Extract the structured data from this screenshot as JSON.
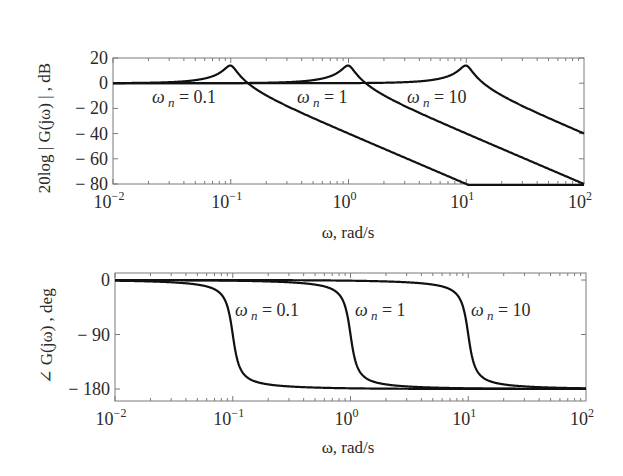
{
  "chart_data": [
    {
      "type": "line",
      "title": "",
      "xlabel": "ω,  rad/s",
      "ylabel": "20log | G(jω) | , dB",
      "xscale": "log",
      "xlim": [
        0.01,
        100
      ],
      "ylim": [
        -80,
        20
      ],
      "xticks": [
        0.01,
        0.1,
        1,
        10,
        100
      ],
      "xtick_labels": [
        {
          "base": "10",
          "exp": "−2"
        },
        {
          "base": "10",
          "exp": "−1"
        },
        {
          "base": "10",
          "exp": "0"
        },
        {
          "base": "10",
          "exp": "1"
        },
        {
          "base": "10",
          "exp": "2"
        }
      ],
      "yticks": [
        20,
        0,
        -20,
        -40,
        -60,
        -80
      ],
      "ytick_labels": [
        "20",
        "0",
        "− 20",
        "− 40",
        "− 60",
        "− 80"
      ],
      "grid": false,
      "legend": "none (inline annotations)",
      "model": {
        "form": "ωn² / (s² + 2ζωn s + ωn²)",
        "zeta": 0.1
      },
      "series": [
        {
          "name": "ωn = 0.1",
          "wn": 0.1,
          "x": [
            0.01,
            0.05,
            0.1,
            0.2,
            1,
            10
          ],
          "values": [
            0.0,
            2.4,
            14.0,
            -9.5,
            -40.0,
            -80.0
          ]
        },
        {
          "name": "ωn = 1",
          "wn": 1,
          "x": [
            0.01,
            0.5,
            1,
            2,
            10,
            100
          ],
          "values": [
            0.0,
            2.4,
            14.0,
            -9.5,
            -40.0,
            -80.0
          ]
        },
        {
          "name": "ωn = 10",
          "wn": 10,
          "x": [
            0.01,
            5,
            10,
            20,
            100
          ],
          "values": [
            0.0,
            2.4,
            14.0,
            -9.5,
            -40.0
          ]
        }
      ],
      "annotations": [
        {
          "text_var": "ω",
          "text_sub": "n",
          "text_rest": " = 0.1",
          "x_px": 152,
          "y_px": 103
        },
        {
          "text_var": "ω",
          "text_sub": "n",
          "text_rest": " = 1",
          "x_px": 297,
          "y_px": 103
        },
        {
          "text_var": "ω",
          "text_sub": "n",
          "text_rest": " = 10",
          "x_px": 407,
          "y_px": 103
        }
      ]
    },
    {
      "type": "line",
      "title": "",
      "xlabel": "ω,  rad/s",
      "ylabel": "∠ G(jω) , deg",
      "xscale": "log",
      "xlim": [
        0.01,
        100
      ],
      "ylim": [
        -195,
        12
      ],
      "xticks": [
        0.01,
        0.1,
        1,
        10,
        100
      ],
      "xtick_labels": [
        {
          "base": "10",
          "exp": "−2"
        },
        {
          "base": "10",
          "exp": "−1"
        },
        {
          "base": "10",
          "exp": "0"
        },
        {
          "base": "10",
          "exp": "1"
        },
        {
          "base": "10",
          "exp": "2"
        }
      ],
      "yticks": [
        0,
        -90,
        -180
      ],
      "ytick_labels": [
        "0",
        "− 90",
        "− 180"
      ],
      "grid": false,
      "legend": "none (inline annotations)",
      "model": {
        "form": "ωn² / (s² + 2ζωn s + ωn²)",
        "zeta": 0.1
      },
      "series": [
        {
          "name": "ωn = 0.1",
          "wn": 0.1,
          "x": [
            0.01,
            0.05,
            0.1,
            0.2,
            1,
            100
          ],
          "values": [
            -1.2,
            -7.6,
            -90.0,
            -172.4,
            -178.8,
            -180.0
          ]
        },
        {
          "name": "ωn = 1",
          "wn": 1,
          "x": [
            0.01,
            0.5,
            1,
            2,
            10,
            100
          ],
          "values": [
            -0.1,
            -7.6,
            -90.0,
            -172.4,
            -178.8,
            -179.9
          ]
        },
        {
          "name": "ωn = 10",
          "wn": 10,
          "x": [
            0.01,
            5,
            10,
            20,
            100
          ],
          "values": [
            0.0,
            -7.6,
            -90.0,
            -172.4,
            -178.8
          ]
        }
      ],
      "annotations": [
        {
          "text_var": "ω",
          "text_sub": "n",
          "text_rest": " = 0.1",
          "x_px": 235,
          "y_px": 316
        },
        {
          "text_var": "ω",
          "text_sub": "n",
          "text_rest": " = 1",
          "x_px": 355,
          "y_px": 316
        },
        {
          "text_var": "ω",
          "text_sub": "n",
          "text_rest": " = 10",
          "x_px": 471,
          "y_px": 316
        }
      ]
    }
  ],
  "layout_px": {
    "plots": [
      {
        "left": 113,
        "right": 584,
        "top": 58,
        "bottom": 184,
        "ymap": [
          [
            20,
            58
          ],
          [
            -80,
            184
          ]
        ]
      },
      {
        "left": 115,
        "right": 586,
        "top": 273,
        "bottom": 401,
        "ymap": [
          [
            0,
            280
          ],
          [
            -180,
            389
          ]
        ]
      }
    ]
  }
}
